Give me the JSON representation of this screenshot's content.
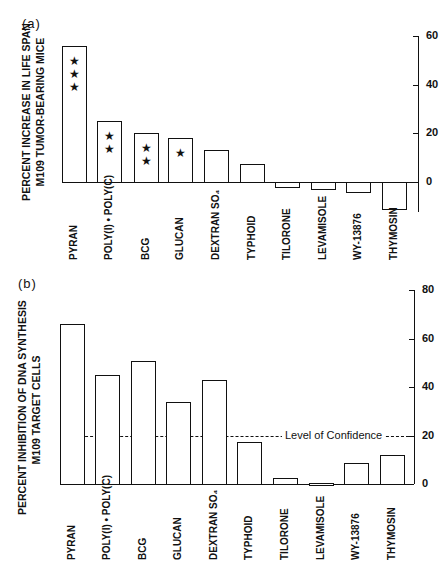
{
  "chart_data": [
    {
      "type": "bar",
      "panel_label": "(a)",
      "title": "",
      "ylabel_line1": "PERCENT INCREASE IN LIFE SPAN",
      "ylabel_line2": "M109 TUMOR-BEARING MICE",
      "xlabel": "",
      "categories": [
        "PYRAN",
        "POLY(I) • POLY(C)",
        "BCG",
        "GLUCAN",
        "DEXTRAN SO₄",
        "TYPHOID",
        "TILORONE",
        "LEVAMISOLE",
        "WY-13876",
        "THYMOSIN"
      ],
      "values": [
        56,
        25,
        20,
        18,
        13,
        7.5,
        -2,
        -3,
        -4,
        -11
      ],
      "significance_stars": [
        3,
        2,
        2,
        1,
        0,
        0,
        0,
        0,
        0,
        0
      ],
      "yticks": [
        0,
        20,
        40,
        60
      ],
      "ylim": [
        -12,
        60
      ],
      "axis_position": "right",
      "grid": false
    },
    {
      "type": "bar",
      "panel_label": "(b)",
      "title": "",
      "ylabel_line1": "PERCENT INHIBITION OF DNA SYNTHESIS",
      "ylabel_line2": "M109 TARGET CELLS",
      "xlabel": "",
      "categories": [
        "PYRAN",
        "POLY(I) • POLY(C)",
        "BCG",
        "GLUCAN",
        "DEXTRAN SO₄",
        "TYPHOID",
        "TILORONE",
        "LEVAMISOLE",
        "WY-13876",
        "THYMOSIN"
      ],
      "values": [
        66,
        45,
        51,
        34,
        43,
        17.5,
        2.5,
        0.5,
        8.5,
        12
      ],
      "yticks": [
        0,
        20,
        40,
        60,
        80
      ],
      "ylim": [
        0,
        80
      ],
      "axis_position": "right",
      "grid": false,
      "reference_line": {
        "value": 20,
        "label": "Level of Confidence",
        "style": "dashed"
      }
    }
  ]
}
